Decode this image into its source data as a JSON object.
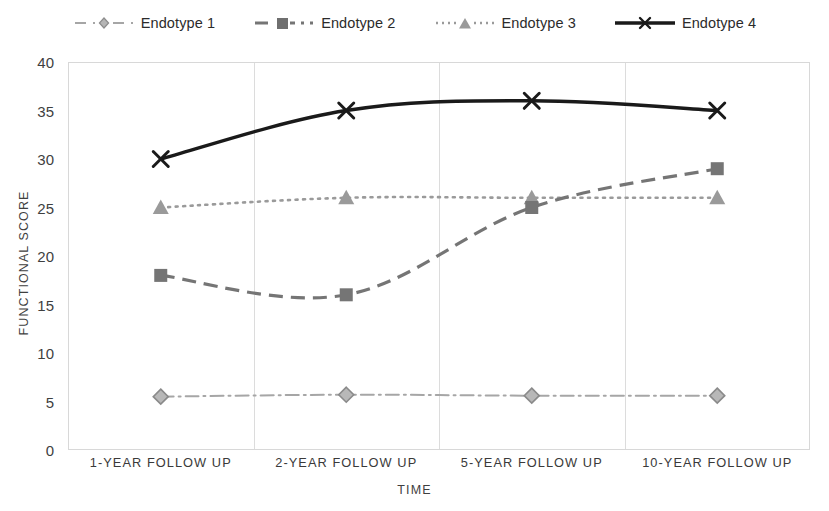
{
  "chart_data": {
    "type": "line",
    "title": "",
    "xlabel": "TIME",
    "ylabel": "FUNCTIONAL SCORE",
    "categories": [
      "1-YEAR FOLLOW UP",
      "2-YEAR FOLLOW UP",
      "5-YEAR FOLLOW UP",
      "10-YEAR FOLLOW UP"
    ],
    "ylim": [
      0,
      40
    ],
    "yticks": [
      0,
      5,
      10,
      15,
      20,
      25,
      30,
      35,
      40
    ],
    "grid": "vertical-category-boundaries",
    "legend_position": "top-center",
    "series": [
      {
        "name": "Endotype 1",
        "values": [
          5.5,
          5.7,
          5.6,
          5.6
        ],
        "color": "#a6a6a6",
        "marker": "diamond",
        "dash": "dash-dot"
      },
      {
        "name": "Endotype 2",
        "values": [
          18,
          16,
          25,
          29
        ],
        "color": "#757575",
        "marker": "square",
        "dash": "dashed"
      },
      {
        "name": "Endotype 3",
        "values": [
          25,
          26,
          26,
          26
        ],
        "color": "#9a9a9a",
        "marker": "triangle",
        "dash": "dotted"
      },
      {
        "name": "Endotype 4",
        "values": [
          30,
          35,
          36,
          35
        ],
        "color": "#1a1a1a",
        "marker": "x",
        "dash": "solid"
      }
    ]
  },
  "axes": {
    "y_title": "FUNCTIONAL SCORE",
    "x_title": "TIME",
    "y_ticks": [
      "40",
      "35",
      "30",
      "25",
      "20",
      "15",
      "10",
      "5",
      "0"
    ],
    "x_ticks": [
      "1-YEAR FOLLOW UP",
      "2-YEAR FOLLOW UP",
      "5-YEAR FOLLOW UP",
      "10-YEAR FOLLOW UP"
    ]
  },
  "legend": {
    "items": [
      {
        "label": "Endotype 1"
      },
      {
        "label": "Endotype 2"
      },
      {
        "label": "Endotype 3"
      },
      {
        "label": "Endotype 4"
      }
    ]
  },
  "colors": {
    "endotype1": "#a6a6a6",
    "endotype2": "#757575",
    "endotype3": "#9a9a9a",
    "endotype4": "#1a1a1a",
    "grid": "#dcdcdc",
    "frame": "#d8d8d8",
    "text": "#3a3a3a"
  }
}
